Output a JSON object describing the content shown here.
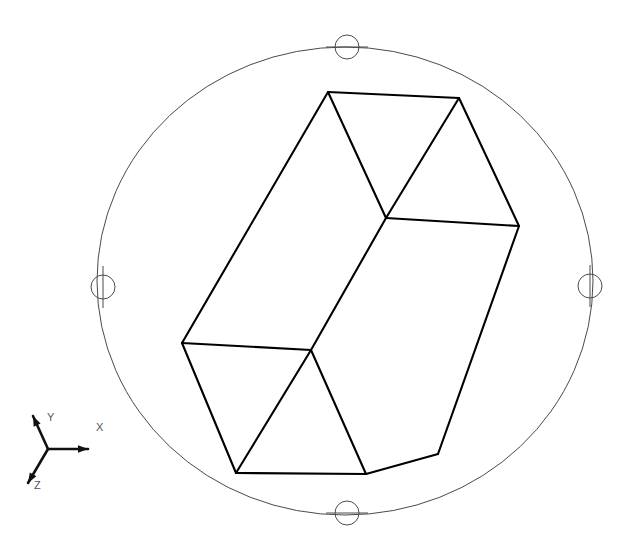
{
  "app": {
    "title": "3D Orbit Viewport",
    "background_color": "#ffffff",
    "canvas_width": 631,
    "canvas_height": 556
  },
  "viewport": {
    "name": "3d-model-viewport",
    "model_name": "triangular-prism-wireframe",
    "model_stroke_color": "#000000",
    "model_stroke_width": 2.1
  },
  "orbit_gizmo": {
    "name": "orbit-ring",
    "stroke_color": "#4a4a4a",
    "center_x": 345,
    "center_y": 281,
    "radius_x": 248,
    "radius_y": 234,
    "handles": [
      {
        "id": "orbit-handle-top",
        "label": "Top",
        "cx": 347,
        "cy": 47,
        "r": 12,
        "tick": "horizontal"
      },
      {
        "id": "orbit-handle-right",
        "label": "Right",
        "cx": 590,
        "cy": 286,
        "r": 12,
        "tick": "vertical"
      },
      {
        "id": "orbit-handle-bottom",
        "label": "Bottom",
        "cx": 347,
        "cy": 513,
        "r": 12,
        "tick": "horizontal"
      },
      {
        "id": "orbit-handle-left",
        "label": "Left",
        "cx": 103,
        "cy": 287,
        "r": 12,
        "tick": "vertical"
      }
    ]
  },
  "axis_triad": {
    "name": "axis-triad-indicator",
    "origin_x": 48,
    "origin_y": 449,
    "color": "#111111",
    "label_color": "#555555",
    "axes": [
      {
        "id": "axis-x",
        "label": "X",
        "tip_x": 88,
        "tip_y": 449,
        "label_x": 96,
        "label_y": 431
      },
      {
        "id": "axis-y",
        "label": "Y",
        "tip_x": 33,
        "tip_y": 416,
        "label_x": 47,
        "label_y": 421
      },
      {
        "id": "axis-z",
        "label": "Z",
        "tip_x": 28,
        "tip_y": 483,
        "label_x": 34,
        "label_y": 489
      }
    ]
  },
  "geometry": {
    "description": "Wireframe triangular prism rendered in isometric-like projection",
    "vertices": {
      "top_apex_left": {
        "x": 328,
        "y": 92
      },
      "top_right": {
        "x": 459,
        "y": 98
      },
      "mid_right_far": {
        "x": 519,
        "y": 226
      },
      "center_junction": {
        "x": 386,
        "y": 218
      },
      "left_vertex": {
        "x": 182,
        "y": 343
      },
      "lower_junction": {
        "x": 311,
        "y": 350
      },
      "bottom_left": {
        "x": 236,
        "y": 473
      },
      "bottom_right": {
        "x": 366,
        "y": 474
      },
      "right_lower": {
        "x": 438,
        "y": 454
      }
    },
    "edges": [
      {
        "id": "edge-top-ridge",
        "from": "top_apex_left",
        "to": "top_right"
      },
      {
        "id": "edge-top-right-slope",
        "from": "top_right",
        "to": "mid_right_far"
      },
      {
        "id": "edge-top-inner-slope",
        "from": "top_apex_left",
        "to": "center_junction"
      },
      {
        "id": "edge-center-to-topright",
        "from": "center_junction",
        "to": "top_right"
      },
      {
        "id": "edge-center-horiz",
        "from": "center_junction",
        "to": "mid_right_far"
      },
      {
        "id": "edge-left-long",
        "from": "top_apex_left",
        "to": "left_vertex"
      },
      {
        "id": "edge-center-long",
        "from": "center_junction",
        "to": "lower_junction"
      },
      {
        "id": "edge-right-long",
        "from": "mid_right_far",
        "to": "right_lower"
      },
      {
        "id": "edge-lower-horiz",
        "from": "left_vertex",
        "to": "lower_junction"
      },
      {
        "id": "edge-left-down",
        "from": "left_vertex",
        "to": "bottom_left"
      },
      {
        "id": "edge-bottom-ridge",
        "from": "bottom_left",
        "to": "bottom_right"
      },
      {
        "id": "edge-lower-inner-left",
        "from": "lower_junction",
        "to": "bottom_left"
      },
      {
        "id": "edge-lower-inner-right",
        "from": "lower_junction",
        "to": "bottom_right"
      },
      {
        "id": "edge-bottom-right-up",
        "from": "bottom_right",
        "to": "right_lower"
      }
    ]
  }
}
